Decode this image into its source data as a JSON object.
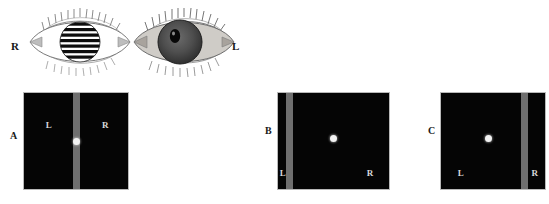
{
  "figure": {
    "background_color": "#ffffff",
    "panel_background_color": "#050505",
    "bar_color": "#6f6f6f",
    "dot_color": "#f2f2f2",
    "inner_label_color": "#d8d8d8",
    "outer_label_color": "#161616"
  },
  "eyes": {
    "right_eye": {
      "side_label": "R",
      "iris_appearance": "striped-grating",
      "sclera_color": "#ffffff",
      "iris_color": "#0d0d0d"
    },
    "left_eye": {
      "side_label": "L",
      "iris_appearance": "solid-dark",
      "sclera_color": "#d6d2cc",
      "iris_color": "#4a4a4a",
      "pupil_color": "#0a0a0a"
    }
  },
  "panels": [
    {
      "letter": "A",
      "bar_position": "center",
      "dot_position": "center-on-bar",
      "left_label": "L",
      "right_label": "R"
    },
    {
      "letter": "B",
      "bar_position": "near-left",
      "dot_position": "center",
      "left_label": "L",
      "right_label": "R"
    },
    {
      "letter": "C",
      "bar_position": "near-right",
      "dot_position": "center",
      "left_label": "L",
      "right_label": "R"
    }
  ]
}
